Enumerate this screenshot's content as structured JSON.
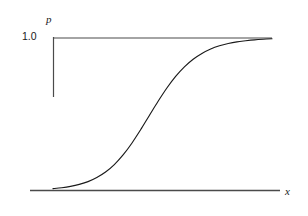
{
  "chart_data": {
    "type": "line",
    "title": "",
    "subtitle": "",
    "xlabel": "x",
    "ylabel": "p",
    "ylim": [
      0,
      1.0
    ],
    "xlim": [
      0,
      1
    ],
    "grid": false,
    "legend": null,
    "y_ticks": [
      {
        "value": 1.0,
        "label": "1.0"
      }
    ],
    "x_ticks": [],
    "annotations": [
      {
        "text": "asymptote at p = 1.0",
        "kind": "reference-line",
        "value": 1.0
      }
    ],
    "series": [
      {
        "name": "logistic curve",
        "color": "#1a1a1a",
        "x": [
          0.0,
          0.04,
          0.08,
          0.12,
          0.16,
          0.2,
          0.24,
          0.28,
          0.32,
          0.36,
          0.4,
          0.44,
          0.48,
          0.52,
          0.56,
          0.6,
          0.64,
          0.68,
          0.72,
          0.76,
          0.8,
          0.84,
          0.88,
          0.92,
          0.96,
          1.0
        ],
        "values": [
          0.012,
          0.018,
          0.027,
          0.04,
          0.058,
          0.085,
          0.121,
          0.17,
          0.233,
          0.31,
          0.398,
          0.492,
          0.585,
          0.672,
          0.748,
          0.811,
          0.861,
          0.899,
          0.928,
          0.949,
          0.964,
          0.975,
          0.982,
          0.988,
          0.992,
          0.995
        ]
      }
    ]
  },
  "axes": {
    "y_axis_label": "p",
    "x_axis_label": "x",
    "y_tick_top": "1.0"
  },
  "colors": {
    "curve": "#1a1a1a",
    "axis": "#4a4a4a",
    "reference_line": "#4a4a4a",
    "background": "#ffffff"
  }
}
